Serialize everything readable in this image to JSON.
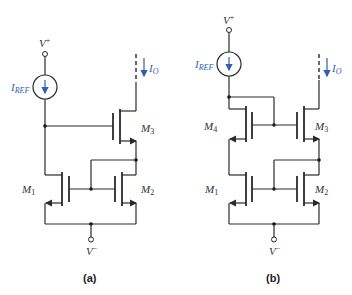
{
  "figure": {
    "panels": [
      {
        "id": "a",
        "caption": "(a)",
        "supply_top": "V",
        "supply_top_sup": "+",
        "supply_bottom": "V",
        "supply_bottom_sup": "−",
        "source": {
          "label": "I",
          "sub": "REF"
        },
        "output": {
          "label": "I",
          "sub": "O"
        },
        "transistors": [
          {
            "name": "M",
            "sub": "1"
          },
          {
            "name": "M",
            "sub": "2"
          },
          {
            "name": "M",
            "sub": "3"
          }
        ]
      },
      {
        "id": "b",
        "caption": "(b)",
        "supply_top": "V",
        "supply_top_sup": "+",
        "supply_bottom": "V",
        "supply_bottom_sup": "−",
        "source": {
          "label": "I",
          "sub": "REF"
        },
        "output": {
          "label": "I",
          "sub": "O"
        },
        "transistors": [
          {
            "name": "M",
            "sub": "4"
          },
          {
            "name": "M",
            "sub": "3"
          },
          {
            "name": "M",
            "sub": "1"
          },
          {
            "name": "M",
            "sub": "2"
          }
        ]
      }
    ],
    "colors": {
      "wire": "#2a2a2a",
      "accent": "#2f5fb3"
    }
  }
}
